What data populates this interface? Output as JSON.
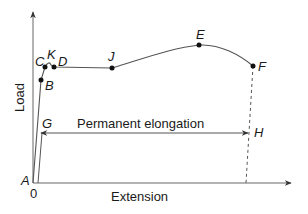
{
  "diagram": {
    "type": "load-extension curve",
    "axes": {
      "y_label": "Load",
      "x_label": "Extension",
      "origin_label": "0"
    },
    "points": [
      {
        "id": "A",
        "label": "A"
      },
      {
        "id": "B",
        "label": "B"
      },
      {
        "id": "C",
        "label": "C"
      },
      {
        "id": "K",
        "label": "K"
      },
      {
        "id": "D",
        "label": "D"
      },
      {
        "id": "J",
        "label": "J"
      },
      {
        "id": "E",
        "label": "E"
      },
      {
        "id": "F",
        "label": "F"
      },
      {
        "id": "G",
        "label": "G"
      },
      {
        "id": "H",
        "label": "H"
      }
    ],
    "annotation": {
      "permanent_elongation": "Permanent elongation"
    },
    "colors": {
      "line": "#555555",
      "text": "#1a1a1a"
    }
  }
}
